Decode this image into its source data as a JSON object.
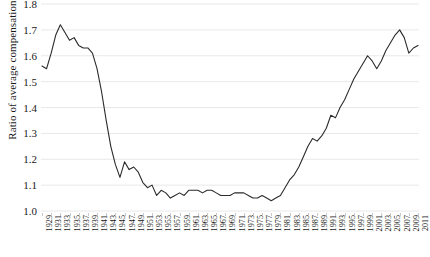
{
  "chart_data": {
    "type": "line",
    "title": "",
    "xlabel": "",
    "ylabel": "Ratio of average compensation",
    "ylim": [
      1.0,
      1.8
    ],
    "yticks": [
      1.0,
      1.1,
      1.2,
      1.3,
      1.4,
      1.5,
      1.6,
      1.7,
      1.8
    ],
    "ytick_labels": [
      "1.0",
      "1.1",
      "1.2",
      "1.3",
      "1.4",
      "1.5",
      "1.6",
      "1.7",
      "1.8"
    ],
    "xlim": [
      1929,
      2011
    ],
    "xtick_labels": [
      "1929",
      "1931",
      "1933",
      "1935",
      "1937",
      "1939",
      "1941",
      "1943",
      "1945",
      "1947",
      "1949",
      "1951",
      "1953",
      "1955",
      "1957",
      "1959",
      "1961",
      "1963",
      "1965",
      "1967",
      "1969",
      "1971",
      "1973",
      "1975",
      "1977",
      "1979",
      "1981",
      "1983",
      "1985",
      "1987",
      "1989",
      "1991",
      "1993",
      "1995",
      "1997",
      "1999",
      "2001",
      "2003",
      "2005",
      "2007",
      "2009",
      "2011"
    ],
    "grid": true,
    "grid_axis": "y",
    "grid_color": "#e8e8e8",
    "legend": "none",
    "line_color": "#2b2b2b",
    "line_width": 1.1,
    "x": [
      1929,
      1930,
      1931,
      1932,
      1933,
      1934,
      1935,
      1936,
      1937,
      1938,
      1939,
      1940,
      1941,
      1942,
      1943,
      1944,
      1945,
      1946,
      1947,
      1948,
      1949,
      1950,
      1951,
      1952,
      1953,
      1954,
      1955,
      1956,
      1957,
      1958,
      1959,
      1960,
      1961,
      1962,
      1963,
      1964,
      1965,
      1966,
      1967,
      1968,
      1969,
      1970,
      1971,
      1972,
      1973,
      1974,
      1975,
      1976,
      1977,
      1978,
      1979,
      1980,
      1981,
      1982,
      1983,
      1984,
      1985,
      1986,
      1987,
      1988,
      1989,
      1990,
      1991,
      1992,
      1993,
      1994,
      1995,
      1996,
      1997,
      1998,
      1999,
      2000,
      2001,
      2002,
      2003,
      2004,
      2005,
      2006,
      2007,
      2008,
      2009,
      2010,
      2011
    ],
    "values": [
      1.56,
      1.55,
      1.61,
      1.68,
      1.72,
      1.69,
      1.66,
      1.67,
      1.64,
      1.63,
      1.63,
      1.61,
      1.55,
      1.46,
      1.35,
      1.25,
      1.18,
      1.13,
      1.19,
      1.16,
      1.17,
      1.15,
      1.11,
      1.09,
      1.1,
      1.06,
      1.08,
      1.07,
      1.05,
      1.06,
      1.07,
      1.06,
      1.08,
      1.08,
      1.08,
      1.07,
      1.08,
      1.08,
      1.07,
      1.06,
      1.06,
      1.06,
      1.07,
      1.07,
      1.07,
      1.06,
      1.05,
      1.05,
      1.06,
      1.05,
      1.04,
      1.05,
      1.06,
      1.09,
      1.12,
      1.14,
      1.17,
      1.21,
      1.25,
      1.28,
      1.27,
      1.29,
      1.32,
      1.37,
      1.36,
      1.4,
      1.43,
      1.47,
      1.51,
      1.54,
      1.57,
      1.6,
      1.58,
      1.55,
      1.58,
      1.62,
      1.65,
      1.68,
      1.7,
      1.67,
      1.61,
      1.63,
      1.64
    ]
  }
}
